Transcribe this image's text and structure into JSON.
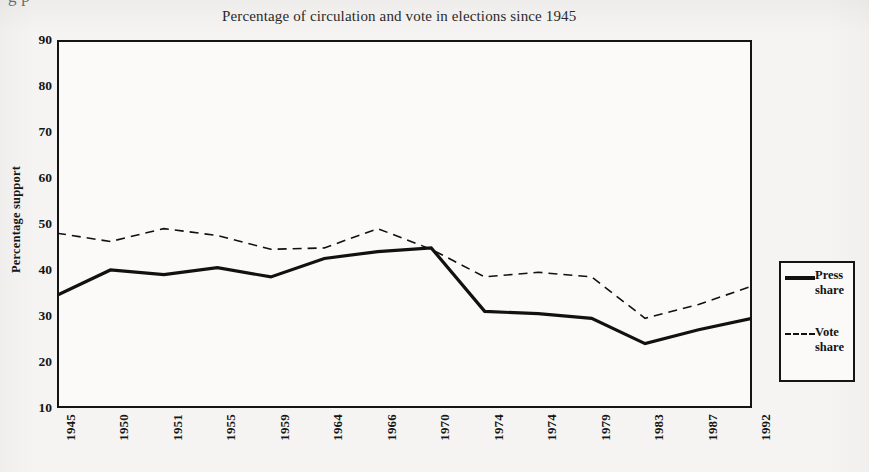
{
  "page": {
    "cutoff_top_text": "g                         p"
  },
  "chart_title": "Percentage of circulation and vote in elections since 1945",
  "axes": {
    "y_title": "Percentage support",
    "y_ticks": [
      "90",
      "80",
      "70",
      "60",
      "50",
      "40",
      "30",
      "20",
      "10"
    ],
    "x_ticks": [
      "1945",
      "1950",
      "1951",
      "1955",
      "1959",
      "1964",
      "1966",
      "1970",
      "1974",
      "1974",
      "1979",
      "1983",
      "1987",
      "1992"
    ]
  },
  "legend": {
    "entries": [
      {
        "label": "Press\nshare",
        "line1": "Press",
        "line2": "share",
        "style": "solid",
        "color": "#111111"
      },
      {
        "label": "Vote\nshare",
        "line1": "Vote",
        "line2": "share",
        "style": "dashed",
        "color": "#111111"
      }
    ]
  },
  "chart_data": {
    "type": "line",
    "title": "Percentage of circulation and vote in elections since 1945",
    "xlabel": "",
    "ylabel": "Percentage support",
    "ylim": [
      10,
      90
    ],
    "ytick_step": 10,
    "grid": false,
    "legend_position": "right-outside",
    "categories": [
      "1945",
      "1950",
      "1951",
      "1955",
      "1959",
      "1964",
      "1966",
      "1970",
      "1974",
      "1974",
      "1979",
      "1983",
      "1987",
      "1992"
    ],
    "series": [
      {
        "name": "Press share",
        "style": "solid",
        "linewidth": 3.2,
        "color": "#111111",
        "values": [
          34.5,
          40.0,
          39.0,
          40.5,
          38.5,
          42.5,
          44.0,
          44.8,
          31.0,
          30.5,
          29.5,
          24.0,
          27.0,
          29.5
        ]
      },
      {
        "name": "Vote share",
        "style": "dashed",
        "linewidth": 1.6,
        "color": "#111111",
        "values": [
          48.0,
          46.2,
          49.0,
          47.5,
          44.5,
          44.8,
          49.0,
          44.5,
          38.5,
          39.5,
          38.5,
          29.5,
          32.5,
          36.5
        ]
      }
    ]
  }
}
